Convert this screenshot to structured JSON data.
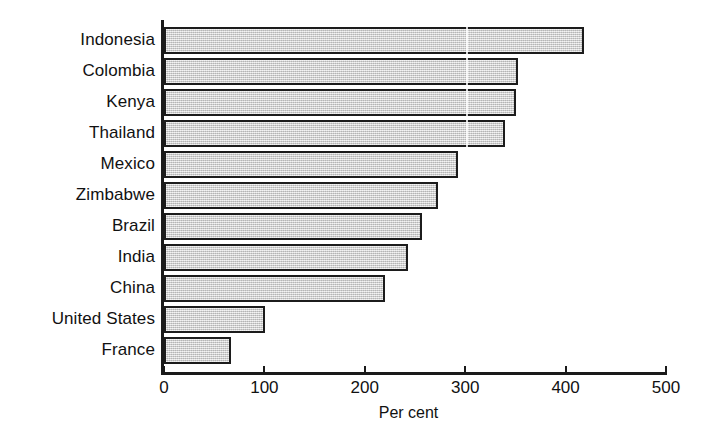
{
  "chart_data": {
    "type": "bar",
    "orientation": "horizontal",
    "title": "",
    "subtitle": "",
    "xlabel": "Per cent",
    "ylabel": "",
    "xlim": [
      0,
      500
    ],
    "xticks": [
      0,
      100,
      200,
      300,
      400,
      500
    ],
    "xtick_labels": [
      "0",
      "100",
      "200",
      "300",
      "400",
      "500"
    ],
    "grid": false,
    "legend": null,
    "categories": [
      "Indonesia",
      "Colombia",
      "Kenya",
      "Thailand",
      "Mexico",
      "Zimbabwe",
      "Brazil",
      "India",
      "China",
      "United States",
      "France"
    ],
    "values": [
      418,
      353,
      351,
      340,
      293,
      273,
      257,
      243,
      220,
      101,
      67
    ],
    "bar_color": "#d2d2d2",
    "bar_edge_color": "#1c1c1c"
  },
  "axis": {
    "title": "Per cent"
  }
}
